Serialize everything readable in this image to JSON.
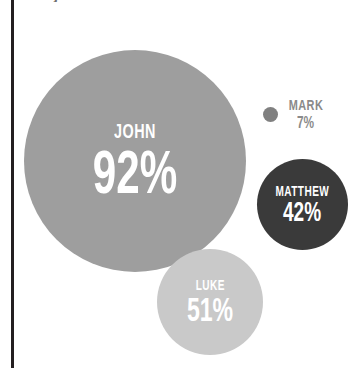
{
  "chart_data": {
    "type": "bubble",
    "title": "Subject attainment",
    "xlabel": "",
    "ylabel": "",
    "legend": "none",
    "grid": true,
    "unit": "%",
    "categories": [
      "JOHN",
      "LUKE",
      "MATTHEW",
      "MARK"
    ],
    "values": [
      92,
      51,
      42,
      7
    ],
    "series": [
      {
        "name": "attainment",
        "points": [
          {
            "label": "JOHN",
            "value": 92,
            "display": "92%",
            "color": "#9e9e9e",
            "label_position": "inside"
          },
          {
            "label": "LUKE",
            "value": 51,
            "display": "51%",
            "color": "#c9c9c9",
            "label_position": "inside"
          },
          {
            "label": "MATTHEW",
            "value": 42,
            "display": "42%",
            "color": "#3a3a3a",
            "label_position": "inside"
          },
          {
            "label": "MARK",
            "value": 7,
            "display": "7%",
            "color": "#808080",
            "label_position": "outside"
          }
        ]
      }
    ]
  },
  "bubbles": {
    "john": {
      "name": "JOHN",
      "value": "92%"
    },
    "luke": {
      "name": "LUKE",
      "value": "51%"
    },
    "matthew": {
      "name": "MATTHEW",
      "value": "42%"
    },
    "mark": {
      "name": "MARK",
      "value": "7%"
    }
  },
  "header": {
    "title": "Subject attainment"
  },
  "colors": {
    "background": "#ffffff",
    "rule": "#231f20",
    "john": "#9e9e9e",
    "luke": "#c9c9c9",
    "matthew": "#3a3a3a",
    "mark": "#808080",
    "outside_label_text": "#8a8a8a",
    "inside_label_text": "#ffffff"
  }
}
